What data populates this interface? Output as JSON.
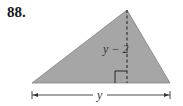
{
  "problem": {
    "number": "88."
  },
  "figure": {
    "shape": "triangle",
    "fill_color": "#a6a6a6",
    "stroke_color": "#7a7a7a",
    "height_label": "y − 2",
    "base_label": "y",
    "right_angle_marker": true,
    "height_line_style": "dashed"
  }
}
